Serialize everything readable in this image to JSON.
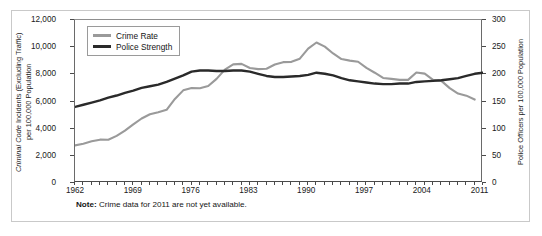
{
  "figure": {
    "note_label": "Note:",
    "note_text": " Crime data for 2011 are not yet available."
  },
  "legend": {
    "items": [
      {
        "label": "Crime Rate",
        "color": "#9a9a9a",
        "axis": "left"
      },
      {
        "label": "Police Strength",
        "color": "#2a2a2a",
        "axis": "right"
      }
    ]
  },
  "axes": {
    "left_title_italic": "Criminal Code",
    "left_title_rest": " Incidents (Excluding Traffic)",
    "left_title_line2": "per 100,000 Population",
    "right_title": "Police Officers per 100,000 Population",
    "left_ticks": [
      "0",
      "2,000",
      "4,000",
      "6,000",
      "8,000",
      "10,000",
      "12,000"
    ],
    "right_ticks": [
      "0",
      "50",
      "100",
      "150",
      "200",
      "250",
      "300"
    ],
    "x_ticks": [
      "1962",
      "1969",
      "1976",
      "1983",
      "1990",
      "1997",
      "2004",
      "2011"
    ]
  },
  "chart_data": {
    "type": "line",
    "title": "",
    "xlabel": "",
    "ylabel": "Criminal Code Incidents (Excluding Traffic) per 100,000 Population",
    "ylabel_right": "Police Officers per 100,000 Population",
    "xlim": [
      1962,
      2011
    ],
    "ylim": [
      0,
      12000
    ],
    "ylim_right": [
      0,
      300
    ],
    "grid": false,
    "legend_position": "top-left-inside",
    "x": [
      1962,
      1963,
      1964,
      1965,
      1966,
      1967,
      1968,
      1969,
      1970,
      1971,
      1972,
      1973,
      1974,
      1975,
      1976,
      1977,
      1978,
      1979,
      1980,
      1981,
      1982,
      1983,
      1984,
      1985,
      1986,
      1987,
      1988,
      1989,
      1990,
      1991,
      1992,
      1993,
      1994,
      1995,
      1996,
      1997,
      1998,
      1999,
      2000,
      2001,
      2002,
      2003,
      2004,
      2005,
      2006,
      2007,
      2008,
      2009,
      2010,
      2011
    ],
    "series": [
      {
        "name": "Crime Rate",
        "axis": "left",
        "color": "#9a9a9a",
        "values": [
          2771,
          2891,
          3067,
          3190,
          3180,
          3470,
          3850,
          4310,
          4750,
          5060,
          5210,
          5390,
          6190,
          6820,
          6990,
          6970,
          7140,
          7666,
          8343,
          8736,
          8773,
          8470,
          8386,
          8412,
          8725,
          8897,
          8919,
          9154,
          9891,
          10342,
          10040,
          9538,
          9124,
          9009,
          8925,
          8475,
          8119,
          7734,
          7666,
          7590,
          7590,
          8132,
          8051,
          7594,
          7518,
          6984,
          6588,
          6431,
          6144,
          null
        ]
      },
      {
        "name": "Police Strength",
        "axis": "right",
        "color": "#2a2a2a",
        "values": [
          140,
          144,
          148,
          152,
          157,
          161,
          166,
          170,
          175,
          178,
          181,
          186,
          192,
          198,
          205,
          207,
          207,
          206,
          206,
          207,
          207,
          205,
          201,
          197,
          195,
          195,
          196,
          197,
          199,
          203,
          201,
          198,
          193,
          189,
          187,
          185,
          183,
          182,
          182,
          183,
          183,
          186,
          187,
          188,
          189,
          191,
          193,
          197,
          201,
          203
        ]
      }
    ]
  }
}
